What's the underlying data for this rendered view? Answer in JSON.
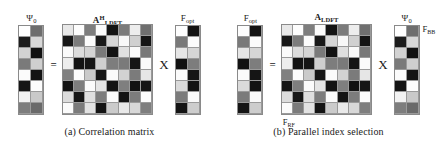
{
  "figure": {
    "panels": [
      {
        "id": "a",
        "caption": "(a) Correlation matrix",
        "left_matrix": {
          "label_base": "Ψ",
          "label_sub": "0",
          "label_sup": "",
          "rows": 8,
          "cols": 2,
          "shades": [
            [
              "#ffffff",
              "#6e6e6e"
            ],
            [
              "#1c1c1c",
              "#d8d8d8"
            ],
            [
              "#d2d2d2",
              "#111111"
            ],
            [
              "#7a7a7a",
              "#cfcfcf"
            ],
            [
              "#fbfbfb",
              "#141414"
            ],
            [
              "#151515",
              "#fdfdfd"
            ],
            [
              "#f2f2f2",
              "#c9c9c9"
            ],
            [
              "#7d7d7d",
              "#6a6a6a"
            ]
          ]
        },
        "op_left": "=",
        "center_matrix": {
          "label_base": "A",
          "label_sub": "LDFT",
          "label_sup": "H",
          "rows": 8,
          "cols": 8,
          "shades": [
            [
              "#e8e8e8",
              "#fdfdfd",
              "#7e7e7e",
              "#fbfbfb",
              "#141414",
              "#7b7b7b",
              "#ededed",
              "#6f6f6f"
            ],
            [
              "#171717",
              "#7c7c7c",
              "#fcfcfc",
              "#191919",
              "#d6d6d6",
              "#f8f8f8",
              "#d0d0d0",
              "#141414"
            ],
            [
              "#fafafa",
              "#dcdcdc",
              "#d4d4d4",
              "#7a7a7a",
              "#121212",
              "#e0e0e0",
              "#fafafa",
              "#787878"
            ],
            [
              "#ededed",
              "#131313",
              "#151515",
              "#cfcfcf",
              "#7d7d7d",
              "#7a7a7a",
              "#151515",
              "#fbfbfb"
            ],
            [
              "#808080",
              "#fcfcfc",
              "#cacaca",
              "#161616",
              "#fafafa",
              "#d2d2d2",
              "#7b7b7b",
              "#e6e6e6"
            ],
            [
              "#141414",
              "#7e7e7e",
              "#fbfbfb",
              "#e4e4e4",
              "#131313",
              "#7f7f7f",
              "#121212",
              "#151515"
            ],
            [
              "#dcdcdc",
              "#161616",
              "#dfdfdf",
              "#7d7d7d",
              "#fbfbfb",
              "#141414",
              "#7c7c7c",
              "#fcfcfc"
            ],
            [
              "#fbfbfb",
              "#7b7b7b",
              "#e2e2e2",
              "#141414",
              "#cbcbcb",
              "#e9e9e9",
              "#d8d8d8",
              "#7e7e7e"
            ]
          ]
        },
        "op_right": "X",
        "right_matrix": {
          "label_base": "F",
          "label_sub": "opt",
          "label_sup": "",
          "rows": 8,
          "cols": 2,
          "shades": [
            [
              "#fdfdfd",
              "#131313"
            ],
            [
              "#797979",
              "#fbfbfb"
            ],
            [
              "#e6e6e6",
              "#d6d6d6"
            ],
            [
              "#121212",
              "#7d7d7d"
            ],
            [
              "#fbfbfb",
              "#151515"
            ],
            [
              "#dadada",
              "#131313"
            ],
            [
              "#7b7b7b",
              "#fafafa"
            ],
            [
              "#141414",
              "#cdcdcd"
            ]
          ]
        },
        "side_label": null,
        "bottom_label": null
      },
      {
        "id": "b",
        "caption": "(b) Parallel index selection",
        "left_matrix": {
          "label_base": "F",
          "label_sub": "opt",
          "label_sup": "",
          "rows": 8,
          "cols": 2,
          "shades": [
            [
              "#fdfdfd",
              "#131313"
            ],
            [
              "#797979",
              "#fbfbfb"
            ],
            [
              "#e6e6e6",
              "#d6d6d6"
            ],
            [
              "#121212",
              "#7d7d7d"
            ],
            [
              "#fbfbfb",
              "#151515"
            ],
            [
              "#dadada",
              "#131313"
            ],
            [
              "#7b7b7b",
              "#fafafa"
            ],
            [
              "#141414",
              "#cdcdcd"
            ]
          ]
        },
        "op_left": "=",
        "center_matrix": {
          "label_base": "A",
          "label_sub": "LDFT",
          "label_sup": "",
          "rows": 8,
          "cols": 8,
          "shades": [
            [
              "#e8e8e8",
              "#fdfdfd",
              "#7e7e7e",
              "#fbfbfb",
              "#141414",
              "#7b7b7b",
              "#ededed",
              "#6f6f6f"
            ],
            [
              "#171717",
              "#7c7c7c",
              "#fcfcfc",
              "#191919",
              "#d6d6d6",
              "#f8f8f8",
              "#d0d0d0",
              "#141414"
            ],
            [
              "#fafafa",
              "#dcdcdc",
              "#d4d4d4",
              "#7a7a7a",
              "#121212",
              "#e0e0e0",
              "#fafafa",
              "#787878"
            ],
            [
              "#ededed",
              "#131313",
              "#151515",
              "#cfcfcf",
              "#7d7d7d",
              "#7a7a7a",
              "#151515",
              "#fbfbfb"
            ],
            [
              "#808080",
              "#fcfcfc",
              "#cacaca",
              "#161616",
              "#fafafa",
              "#d2d2d2",
              "#7b7b7b",
              "#e6e6e6"
            ],
            [
              "#141414",
              "#7e7e7e",
              "#fbfbfb",
              "#e4e4e4",
              "#131313",
              "#7f7f7f",
              "#121212",
              "#151515"
            ],
            [
              "#dcdcdc",
              "#161616",
              "#dfdfdf",
              "#7d7d7d",
              "#fbfbfb",
              "#141414",
              "#7c7c7c",
              "#fcfcfc"
            ],
            [
              "#fbfbfb",
              "#7b7b7b",
              "#e2e2e2",
              "#141414",
              "#cbcbcb",
              "#e9e9e9",
              "#d8d8d8",
              "#7e7e7e"
            ]
          ]
        },
        "op_right": "X",
        "right_matrix": {
          "label_base": "Ψ",
          "label_sub": "0",
          "label_sup": "",
          "rows": 8,
          "cols": 2,
          "shades": [
            [
              "#ffffff",
              "#6e6e6e"
            ],
            [
              "#1c1c1c",
              "#d8d8d8"
            ],
            [
              "#d2d2d2",
              "#111111"
            ],
            [
              "#7a7a7a",
              "#cfcfcf"
            ],
            [
              "#fbfbfb",
              "#141414"
            ],
            [
              "#151515",
              "#fdfdfd"
            ],
            [
              "#f2f2f2",
              "#c9c9c9"
            ],
            [
              "#7d7d7d",
              "#6a6a6a"
            ]
          ]
        },
        "side_label": {
          "base": "F",
          "sub": "BB"
        },
        "bottom_label": {
          "base": "F",
          "sub": "RF"
        }
      }
    ]
  }
}
